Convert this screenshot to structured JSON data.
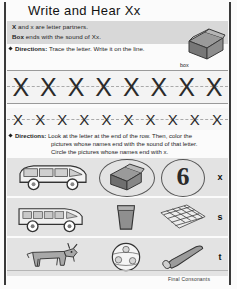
{
  "worksheet": {
    "title": "Write and Hear Xx",
    "footer": "Final Consonants"
  },
  "info": {
    "line1_bold": "X",
    "line1_rest": " and x are letter partners.",
    "line2_bold": "Box",
    "line2_rest": " ends with the sound of Xx.",
    "directions1_label": "Directions:",
    "directions1_text": " Trace the letter. Write it on the line."
  },
  "box_picture": {
    "label": "box",
    "icon": "box-icon"
  },
  "trace": {
    "letter": "X",
    "row1_count": 8,
    "row2_count": 10
  },
  "directions2": {
    "label": "Directions:",
    "line1": " Look at the letter at the end of the row. Then, color the",
    "line2": "pictures whose names end with the sound of that letter.",
    "line3": "Circle the pictures whose names end with x."
  },
  "picture_rows": [
    {
      "end_letter": "x",
      "cells": [
        {
          "name": "van",
          "icon": "van-icon",
          "circled": false
        },
        {
          "name": "box",
          "icon": "box-icon",
          "circled": true
        },
        {
          "name": "six",
          "icon": "six-icon",
          "circled": true
        }
      ]
    },
    {
      "end_letter": "s",
      "cells": [
        {
          "name": "bus",
          "icon": "bus-icon",
          "circled": false
        },
        {
          "name": "glass",
          "icon": "glass-icon",
          "circled": false
        },
        {
          "name": "net",
          "icon": "net-icon",
          "circled": false
        }
      ]
    },
    {
      "end_letter": "t",
      "cells": [
        {
          "name": "goat",
          "icon": "goat-icon",
          "circled": false
        },
        {
          "name": "ball",
          "icon": "ball-icon",
          "circled": false
        },
        {
          "name": "bat",
          "icon": "bat-icon",
          "circled": false
        }
      ]
    }
  ]
}
